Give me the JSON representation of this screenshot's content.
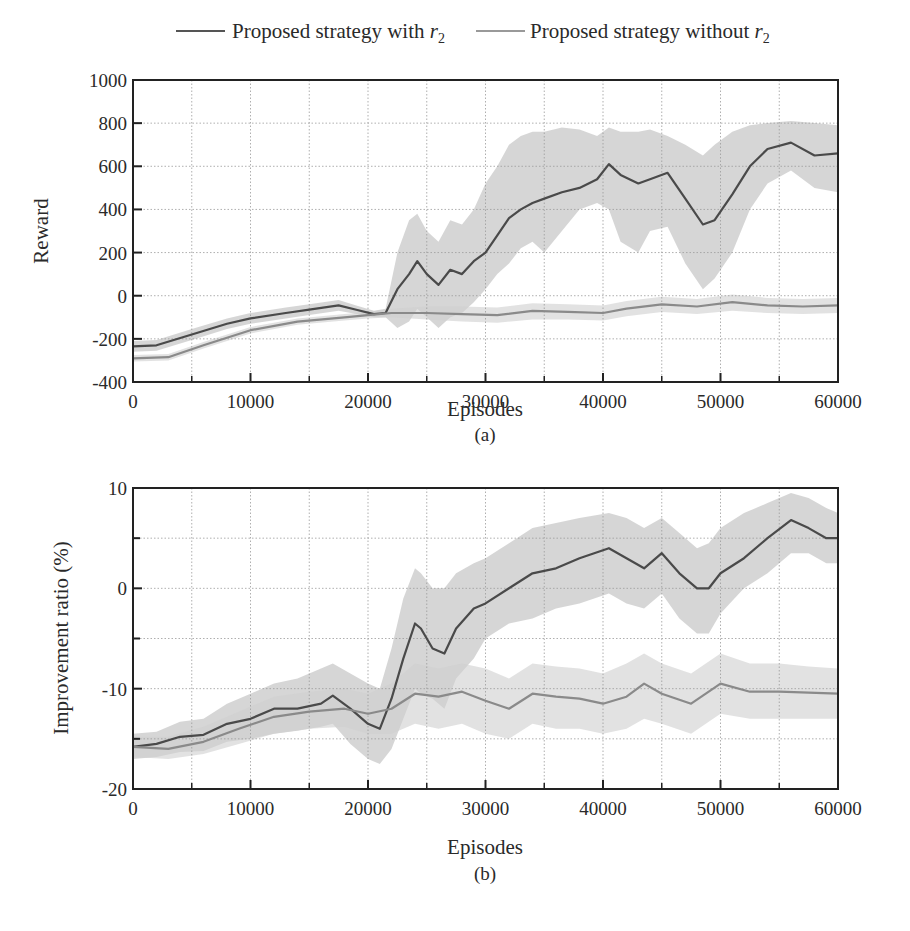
{
  "legend": {
    "items": [
      {
        "label": "Proposed strategy with ",
        "sym": "r",
        "sub": "2",
        "color": "#555555"
      },
      {
        "label": "Proposed strategy without ",
        "sym": "r",
        "sub": "2",
        "color": "#888888"
      }
    ]
  },
  "colors": {
    "with_line": "#4a4a4a",
    "without_line": "#8a8a8a",
    "band": "#cfcfcf",
    "grid": "#9a9a9a",
    "axis": "#222222"
  },
  "chart_data": [
    {
      "type": "line",
      "panel": "a",
      "caption": "(a)",
      "xlabel": "Episodes",
      "ylabel": "Reward",
      "xlim": [
        0,
        60000
      ],
      "ylim": [
        -400,
        1000
      ],
      "xticks": [
        0,
        10000,
        20000,
        30000,
        40000,
        50000,
        60000
      ],
      "yticks": [
        -400,
        -200,
        0,
        200,
        400,
        600,
        800,
        1000
      ],
      "grid": true,
      "legend_position": "top",
      "series": [
        {
          "name": "Proposed strategy with r2",
          "x": [
            0,
            2000,
            5000,
            8000,
            10000,
            13000,
            15000,
            17500,
            19000,
            20500,
            21500,
            22500,
            23500,
            24200,
            25000,
            26000,
            27000,
            28000,
            29000,
            30000,
            31000,
            32000,
            33000,
            34000,
            35000,
            36500,
            38000,
            39500,
            40500,
            41500,
            43000,
            44000,
            45500,
            47000,
            48500,
            49500,
            51000,
            52500,
            54000,
            56000,
            58000,
            60000
          ],
          "y": [
            -235,
            -230,
            -180,
            -130,
            -105,
            -80,
            -65,
            -45,
            -65,
            -85,
            -80,
            30,
            100,
            160,
            100,
            50,
            120,
            100,
            160,
            200,
            280,
            360,
            400,
            430,
            450,
            480,
            500,
            540,
            610,
            560,
            520,
            540,
            570,
            450,
            330,
            350,
            470,
            600,
            680,
            710,
            650,
            660
          ],
          "band_lower": [
            -260,
            -255,
            -205,
            -155,
            -130,
            -105,
            -90,
            -70,
            -85,
            -100,
            -100,
            -150,
            -120,
            -60,
            -100,
            -150,
            -100,
            -80,
            -30,
            30,
            100,
            150,
            220,
            250,
            200,
            300,
            400,
            430,
            400,
            250,
            200,
            300,
            320,
            150,
            30,
            80,
            200,
            400,
            520,
            580,
            500,
            480
          ],
          "band_upper": [
            -210,
            -205,
            -155,
            -105,
            -80,
            -55,
            -40,
            -20,
            -45,
            -70,
            -60,
            200,
            350,
            380,
            300,
            250,
            350,
            330,
            400,
            520,
            600,
            700,
            740,
            760,
            760,
            780,
            770,
            740,
            780,
            760,
            760,
            770,
            740,
            700,
            650,
            700,
            760,
            790,
            800,
            810,
            800,
            790
          ]
        },
        {
          "name": "Proposed strategy without r2",
          "x": [
            0,
            3000,
            6000,
            10000,
            14000,
            18000,
            20000,
            22000,
            25000,
            28000,
            31000,
            34000,
            37000,
            40000,
            42000,
            45000,
            48000,
            51000,
            54000,
            57000,
            60000
          ],
          "y": [
            -290,
            -285,
            -230,
            -160,
            -120,
            -100,
            -90,
            -80,
            -80,
            -85,
            -90,
            -70,
            -75,
            -80,
            -60,
            -40,
            -50,
            -30,
            -45,
            -50,
            -45
          ],
          "band_lower": [
            -305,
            -300,
            -245,
            -175,
            -135,
            -115,
            -105,
            -100,
            -110,
            -120,
            -125,
            -110,
            -110,
            -115,
            -95,
            -75,
            -85,
            -70,
            -80,
            -85,
            -80
          ],
          "band_upper": [
            -275,
            -270,
            -215,
            -145,
            -105,
            -85,
            -75,
            -60,
            -50,
            -50,
            -55,
            -35,
            -40,
            -45,
            -25,
            -5,
            -15,
            5,
            -10,
            -15,
            -10
          ]
        }
      ]
    },
    {
      "type": "line",
      "panel": "b",
      "caption": "(b)",
      "xlabel": "Episodes",
      "ylabel": "Improvement ratio (%)",
      "xlim": [
        0,
        60000
      ],
      "ylim": [
        -20,
        10
      ],
      "xticks": [
        0,
        10000,
        20000,
        30000,
        40000,
        50000,
        60000
      ],
      "yticks": [
        -20,
        -10,
        0,
        10
      ],
      "minor_yticks": [
        -15,
        -5,
        5
      ],
      "grid": true,
      "series": [
        {
          "name": "Proposed strategy with r2",
          "x": [
            0,
            2000,
            4000,
            6000,
            8000,
            10000,
            12000,
            14000,
            16000,
            17000,
            18500,
            20000,
            21000,
            22000,
            23000,
            24000,
            24500,
            25500,
            26500,
            27500,
            29000,
            30000,
            32000,
            34000,
            36000,
            38000,
            40500,
            42000,
            43500,
            45000,
            46500,
            48000,
            49000,
            50000,
            52000,
            54000,
            56000,
            57500,
            59000,
            60000
          ],
          "y": [
            -15.8,
            -15.5,
            -14.8,
            -14.6,
            -13.5,
            -13.0,
            -12.0,
            -12.0,
            -11.5,
            -10.7,
            -12.0,
            -13.5,
            -14.0,
            -11.0,
            -7.0,
            -3.5,
            -4.0,
            -6.0,
            -6.5,
            -4.0,
            -2.0,
            -1.5,
            0.0,
            1.5,
            2.0,
            3.0,
            4.0,
            3.0,
            2.0,
            3.5,
            1.5,
            0.0,
            0.0,
            1.5,
            3.0,
            5.0,
            6.8,
            6.0,
            5.0,
            5.0
          ],
          "band_lower": [
            -17.0,
            -16.8,
            -16.3,
            -16.2,
            -15.3,
            -15.0,
            -14.5,
            -14.2,
            -13.8,
            -13.5,
            -15.5,
            -17.0,
            -17.5,
            -16.0,
            -13.0,
            -10.0,
            -10.5,
            -11.0,
            -12.0,
            -9.0,
            -7.0,
            -5.0,
            -3.5,
            -3.0,
            -2.0,
            -1.5,
            -0.5,
            -1.5,
            -2.0,
            -0.5,
            -3.0,
            -4.5,
            -4.5,
            -2.5,
            0.0,
            1.5,
            3.5,
            3.5,
            2.5,
            2.5
          ],
          "band_upper": [
            -14.5,
            -14.3,
            -13.3,
            -13.0,
            -11.5,
            -10.5,
            -9.5,
            -9.0,
            -8.0,
            -7.5,
            -8.5,
            -9.5,
            -10.0,
            -6.0,
            -1.0,
            2.0,
            1.5,
            0.0,
            0.0,
            1.5,
            2.5,
            3.0,
            4.5,
            6.0,
            6.5,
            7.0,
            7.5,
            7.0,
            6.0,
            7.0,
            5.5,
            4.0,
            4.5,
            6.0,
            7.5,
            8.5,
            9.5,
            9.0,
            8.0,
            7.5
          ]
        },
        {
          "name": "Proposed strategy without r2",
          "x": [
            0,
            3000,
            6000,
            9000,
            12000,
            15000,
            18000,
            20000,
            22000,
            24000,
            26000,
            28000,
            30000,
            32000,
            34000,
            36000,
            38000,
            40000,
            42000,
            43500,
            45000,
            47500,
            50000,
            52500,
            55000,
            57500,
            60000
          ],
          "y": [
            -15.8,
            -16.0,
            -15.3,
            -14.0,
            -12.8,
            -12.3,
            -12.0,
            -12.5,
            -12.0,
            -10.5,
            -10.8,
            -10.3,
            -11.2,
            -12.0,
            -10.5,
            -10.8,
            -11.0,
            -11.5,
            -10.8,
            -9.5,
            -10.5,
            -11.5,
            -9.5,
            -10.3,
            -10.3,
            -10.4,
            -10.5
          ],
          "band_lower": [
            -16.8,
            -17.0,
            -16.5,
            -15.5,
            -14.5,
            -14.0,
            -13.8,
            -14.5,
            -14.5,
            -13.5,
            -14.0,
            -13.5,
            -14.5,
            -15.0,
            -13.5,
            -14.0,
            -14.0,
            -14.5,
            -14.0,
            -13.0,
            -13.5,
            -14.5,
            -12.5,
            -13.0,
            -13.0,
            -13.0,
            -13.0
          ],
          "band_upper": [
            -14.8,
            -14.8,
            -13.8,
            -12.3,
            -10.8,
            -10.3,
            -10.0,
            -10.5,
            -9.5,
            -7.5,
            -8.0,
            -7.5,
            -8.0,
            -9.0,
            -7.5,
            -7.8,
            -8.0,
            -8.5,
            -7.5,
            -6.5,
            -7.5,
            -8.5,
            -6.5,
            -7.5,
            -7.5,
            -7.8,
            -8.0
          ]
        }
      ]
    }
  ]
}
